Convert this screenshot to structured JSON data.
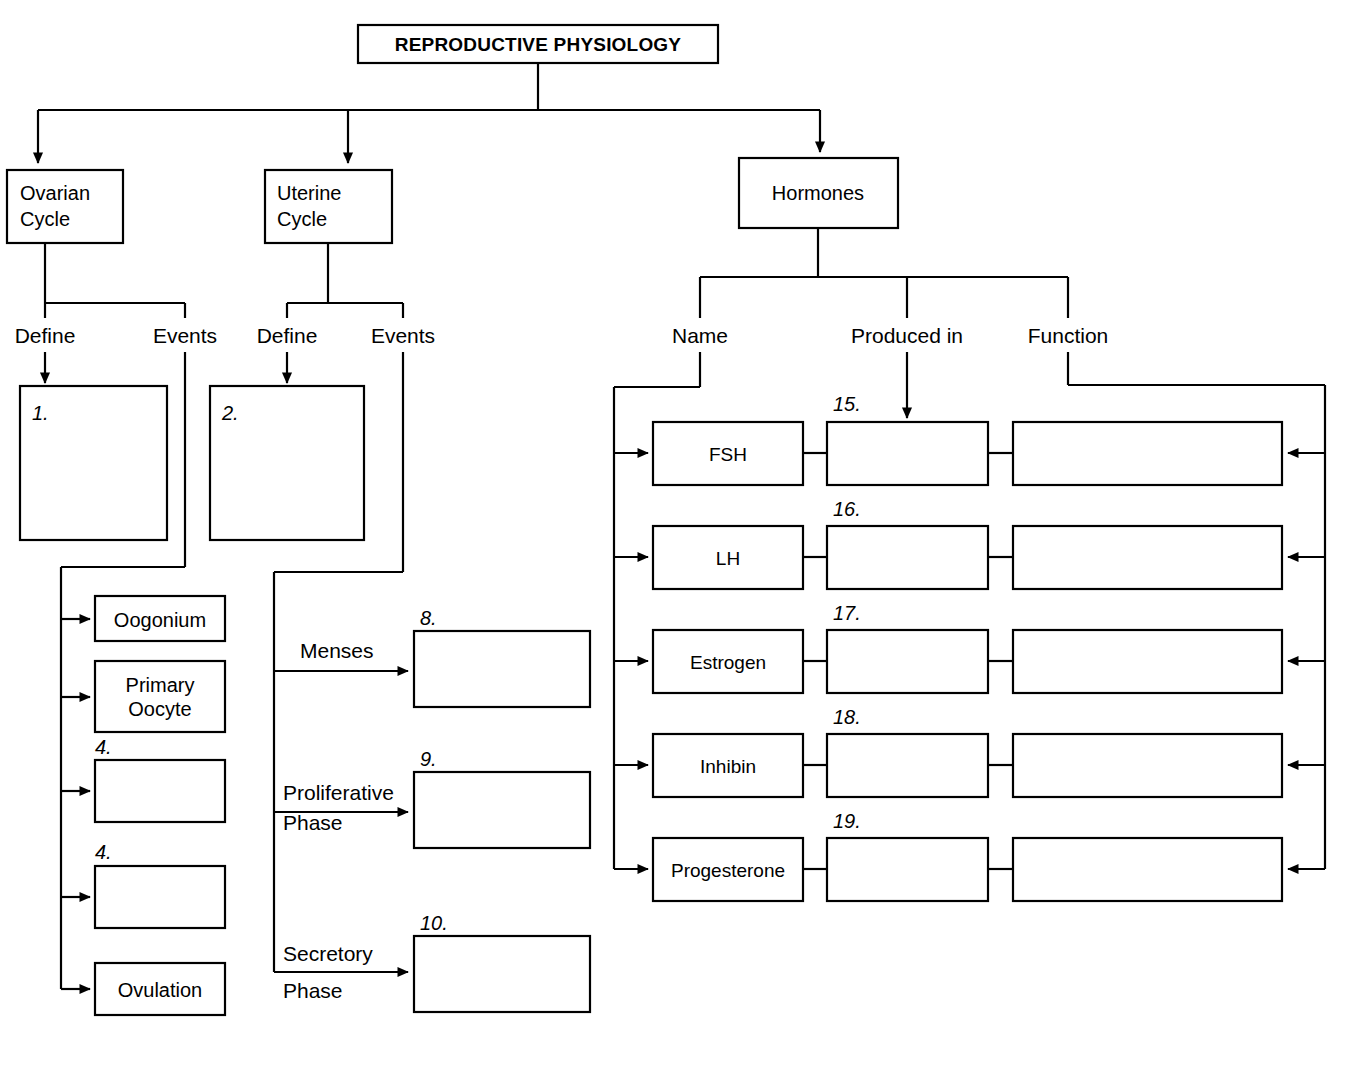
{
  "diagram": {
    "title": "REPRODUCTIVE PHYSIOLOGY",
    "root": {
      "label": "REPRODUCTIVE PHYSIOLOGY"
    },
    "branches": [
      {
        "label": "Ovarian Cycle",
        "line1": "Ovarian",
        "line2": "Cycle"
      },
      {
        "label": "Uterine Cycle",
        "line1": "Uterine",
        "line2": "Cycle"
      },
      {
        "label": "Hormones",
        "line1": "Hormones",
        "line2": ""
      }
    ],
    "ovarian": {
      "sub_labels": {
        "define": "Define",
        "events": "Events"
      },
      "define_box": {
        "number": "1.",
        "value": ""
      },
      "event_boxes": [
        {
          "number": "",
          "value": "Oogonium"
        },
        {
          "number": "",
          "value": "Primary Oocyte",
          "line1": "Primary",
          "line2": "Oocyte"
        },
        {
          "number": "4.",
          "value": ""
        },
        {
          "number": "4.",
          "value": ""
        },
        {
          "number": "",
          "value": "Ovulation"
        }
      ]
    },
    "uterine": {
      "sub_labels": {
        "define": "Define",
        "events": "Events"
      },
      "define_box": {
        "number": "2.",
        "value": ""
      },
      "phases": [
        {
          "label": "Menses",
          "line1": "Menses",
          "line2": "",
          "number": "8.",
          "value": ""
        },
        {
          "label": "Proliferative Phase",
          "line1": "Proliferative",
          "line2": "Phase",
          "number": "9.",
          "value": ""
        },
        {
          "label": "Secretory Phase",
          "line1": "Secretory",
          "line2": "Phase",
          "number": "10.",
          "value": ""
        }
      ]
    },
    "hormones": {
      "column_headers": [
        "Name",
        "Produced in",
        "Function"
      ],
      "rows": [
        {
          "name": "FSH",
          "produced_in_number": "15.",
          "produced_in_value": "",
          "function_value": ""
        },
        {
          "name": "LH",
          "produced_in_number": "16.",
          "produced_in_value": "",
          "function_value": ""
        },
        {
          "name": "Estrogen",
          "produced_in_number": "17.",
          "produced_in_value": "",
          "function_value": ""
        },
        {
          "name": "Inhibin",
          "produced_in_number": "18.",
          "produced_in_value": "",
          "function_value": ""
        },
        {
          "name": "Progesterone",
          "produced_in_number": "19.",
          "produced_in_value": "",
          "function_value": ""
        }
      ]
    },
    "colors": {
      "line": "#000000",
      "box_fill": "#ffffff",
      "text": "#000000"
    }
  }
}
